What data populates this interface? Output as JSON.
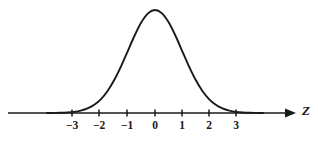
{
  "figure": {
    "background_color": "#ffffff",
    "ink_color": "#1a1a1a"
  },
  "axis": {
    "name_label": "Z",
    "arrow_icon": "arrow-right-icon",
    "line_start_x": 8,
    "line_end_x": 297,
    "baseline_y": 113
  },
  "ticks": [
    {
      "label": "−3",
      "value": -3,
      "x": 72
    },
    {
      "label": "−2",
      "value": -2,
      "x": 99
    },
    {
      "label": "−1",
      "value": -1,
      "x": 127
    },
    {
      "label": "0",
      "value": 0,
      "x": 155
    },
    {
      "label": "1",
      "value": 1,
      "x": 182
    },
    {
      "label": "2",
      "value": 2,
      "x": 209
    },
    {
      "label": "3",
      "value": 3,
      "x": 236
    }
  ],
  "chart_data": {
    "type": "line",
    "xlabel": "Z",
    "ylabel": "",
    "grid": false,
    "legend": null,
    "xlim": [
      -4.2,
      5.0
    ],
    "ylim": [
      0,
      0.42
    ],
    "curve": {
      "name": "standard normal density",
      "mean": 0,
      "sd": 1,
      "peak_value": 0.3989,
      "x": [
        -4.0,
        -3.75,
        -3.5,
        -3.25,
        -3.0,
        -2.75,
        -2.5,
        -2.25,
        -2.0,
        -1.75,
        -1.5,
        -1.25,
        -1.0,
        -0.75,
        -0.5,
        -0.25,
        0.0,
        0.25,
        0.5,
        0.75,
        1.0,
        1.25,
        1.5,
        1.75,
        2.0,
        2.25,
        2.5,
        2.75,
        3.0,
        3.25,
        3.5,
        3.75,
        4.0
      ],
      "y": [
        0.0001,
        0.0004,
        0.0009,
        0.002,
        0.0044,
        0.0091,
        0.0175,
        0.0317,
        0.054,
        0.0863,
        0.1295,
        0.1826,
        0.242,
        0.3011,
        0.3521,
        0.3867,
        0.3989,
        0.3867,
        0.3521,
        0.3011,
        0.242,
        0.1826,
        0.1295,
        0.0863,
        0.054,
        0.0317,
        0.0175,
        0.0091,
        0.0044,
        0.002,
        0.0009,
        0.0004,
        0.0001
      ]
    },
    "tick_values": [
      -3,
      -2,
      -1,
      0,
      1,
      2,
      3
    ],
    "tick_labels": [
      "−3",
      "−2",
      "−1",
      "0",
      "1",
      "2",
      "3"
    ]
  }
}
